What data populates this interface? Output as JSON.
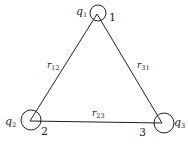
{
  "diagram": {
    "type": "three-charge-triangle",
    "colors": {
      "stroke": "#222222",
      "background": "#ffffff"
    },
    "vertices": [
      {
        "id": "1",
        "number_label": "1",
        "charge_symbol": "q",
        "charge_subscript": "1",
        "x": 97,
        "y": 14,
        "circle_r": 8
      },
      {
        "id": "2",
        "number_label": "2",
        "charge_symbol": "q",
        "charge_subscript": "2",
        "x": 30,
        "y": 121,
        "circle_r": 10
      },
      {
        "id": "3",
        "number_label": "3",
        "charge_symbol": "q",
        "charge_subscript": "3",
        "x": 162,
        "y": 123,
        "circle_r": 10
      }
    ],
    "edges": [
      {
        "from": "1",
        "to": "2",
        "symbol": "r",
        "subscript": "12"
      },
      {
        "from": "2",
        "to": "3",
        "symbol": "r",
        "subscript": "23"
      },
      {
        "from": "3",
        "to": "1",
        "symbol": "r",
        "subscript": "31"
      }
    ]
  }
}
